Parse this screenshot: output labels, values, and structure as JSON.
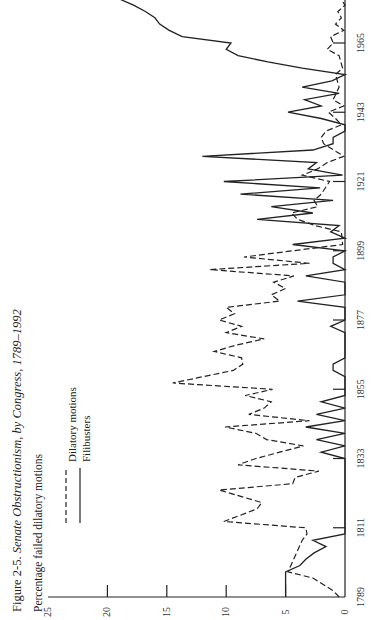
{
  "figure": {
    "title_prefix": "Figure 2-5.",
    "title_italic": "Senate Obstructionism, by Congress, 1789–1992",
    "ylabel": "Percentage failed dilatory motions",
    "legend": [
      {
        "label": "Dilatory motions",
        "style": "dashed"
      },
      {
        "label": "Filibusters",
        "style": "solid"
      }
    ]
  },
  "chart_data": {
    "type": "line",
    "title": "Senate Obstructionism, by Congress, 1789–1992",
    "xlabel": "",
    "ylabel": "Percentage failed dilatory motions",
    "orientation": "rotated -90deg (years run bottom-to-top, values right-to-left)",
    "x_ticks": [
      "1789",
      "1811",
      "1833",
      "1855",
      "1877",
      "1899",
      "1921",
      "1943",
      "1965"
    ],
    "y_ticks": [
      "0",
      "5",
      "10",
      "15",
      "20",
      "25"
    ],
    "ylim": [
      0,
      25
    ],
    "xlim": [
      1789,
      1992
    ],
    "grid": false,
    "legend_position": "upper left (rotated)",
    "series": [
      {
        "name": "Dilatory motions",
        "style": "dashed",
        "points": [
          [
            1789,
            0.5
          ],
          [
            1791,
            1.0
          ],
          [
            1795,
            2.7
          ],
          [
            1797,
            4.8
          ],
          [
            1807,
            3.6
          ],
          [
            1809,
            3.2
          ],
          [
            1811,
            3.3
          ],
          [
            1813,
            10.2
          ],
          [
            1817,
            7.4
          ],
          [
            1819,
            7.0
          ],
          [
            1823,
            10.6
          ],
          [
            1825,
            4.4
          ],
          [
            1827,
            4.2
          ],
          [
            1829,
            2.2
          ],
          [
            1831,
            9.0
          ],
          [
            1833,
            7.5
          ],
          [
            1837,
            3.5
          ],
          [
            1839,
            6.6
          ],
          [
            1841,
            7.5
          ],
          [
            1843,
            10.1
          ],
          [
            1845,
            3.0
          ],
          [
            1847,
            8.1
          ],
          [
            1849,
            6.8
          ],
          [
            1851,
            6.2
          ],
          [
            1853,
            8.4
          ],
          [
            1855,
            6.1
          ],
          [
            1857,
            14.5
          ],
          [
            1861,
            9.4
          ],
          [
            1863,
            8.6
          ],
          [
            1865,
            8.7
          ],
          [
            1867,
            11.0
          ],
          [
            1869,
            9.2
          ],
          [
            1871,
            6.8
          ],
          [
            1873,
            10.0
          ],
          [
            1875,
            8.7
          ],
          [
            1877,
            10.6
          ],
          [
            1879,
            9.3
          ],
          [
            1881,
            10.0
          ],
          [
            1883,
            5.5
          ],
          [
            1885,
            6.2
          ],
          [
            1887,
            5.0
          ],
          [
            1889,
            6.0
          ],
          [
            1891,
            4.3
          ],
          [
            1893,
            11.4
          ],
          [
            1895,
            3.0
          ],
          [
            1897,
            8.5
          ],
          [
            1899,
            4.4
          ],
          [
            1901,
            0.2
          ],
          [
            1905,
            0.3
          ],
          [
            1907,
            2.5
          ],
          [
            1909,
            4.0
          ],
          [
            1911,
            4.5
          ],
          [
            1913,
            2.3
          ],
          [
            1915,
            2.6
          ],
          [
            1917,
            2.0
          ],
          [
            1921,
            1.3
          ],
          [
            1923,
            3.6
          ],
          [
            1925,
            2.3
          ],
          [
            1927,
            1.5
          ],
          [
            1929,
            0.1
          ],
          [
            1933,
            1.8
          ],
          [
            1935,
            2.0
          ],
          [
            1937,
            1.6
          ],
          [
            1939,
            0.3
          ],
          [
            1941,
            0.8
          ],
          [
            1943,
            1.4
          ],
          [
            1945,
            0.1
          ],
          [
            1947,
            1.0
          ],
          [
            1951,
            0.5
          ],
          [
            1955,
            0.8
          ],
          [
            1957,
            0.2
          ],
          [
            1961,
            0.5
          ],
          [
            1963,
            1.5
          ],
          [
            1965,
            1.0
          ],
          [
            1967,
            1.2
          ],
          [
            1969,
            0.1
          ],
          [
            1971,
            0.8
          ],
          [
            1973,
            0.3
          ],
          [
            1975,
            0.6
          ],
          [
            1977,
            0.0
          ],
          [
            1981,
            0.7
          ],
          [
            1983,
            0.2
          ],
          [
            1985,
            0.4
          ],
          [
            1989,
            0.8
          ],
          [
            1991,
            0.2
          ]
        ]
      },
      {
        "name": "Filibusters",
        "style": "solid",
        "points": [
          [
            1789,
            5.0
          ],
          [
            1797,
            5.0
          ],
          [
            1799,
            3.8
          ],
          [
            1801,
            3.3
          ],
          [
            1803,
            2.6
          ],
          [
            1805,
            1.6
          ],
          [
            1807,
            2.7
          ],
          [
            1809,
            0.0
          ],
          [
            1833,
            0.0
          ],
          [
            1835,
            2.0
          ],
          [
            1837,
            0.0
          ],
          [
            1839,
            2.4
          ],
          [
            1841,
            0.0
          ],
          [
            1843,
            3.3
          ],
          [
            1845,
            0.0
          ],
          [
            1847,
            2.4
          ],
          [
            1849,
            0.0
          ],
          [
            1851,
            2.0
          ],
          [
            1853,
            0.0
          ],
          [
            1859,
            0.0
          ],
          [
            1861,
            1.0
          ],
          [
            1863,
            1.0
          ],
          [
            1865,
            0.0
          ],
          [
            1873,
            0.0
          ],
          [
            1875,
            1.2
          ],
          [
            1877,
            0.0
          ],
          [
            1881,
            0.0
          ],
          [
            1883,
            4.0
          ],
          [
            1885,
            0.0
          ],
          [
            1889,
            0.0
          ],
          [
            1891,
            3.3
          ],
          [
            1893,
            0.0
          ],
          [
            1895,
            1.0
          ],
          [
            1897,
            1.0
          ],
          [
            1899,
            0.0
          ],
          [
            1901,
            4.4
          ],
          [
            1903,
            0.0
          ],
          [
            1905,
            1.2
          ],
          [
            1907,
            0.5
          ],
          [
            1909,
            7.4
          ],
          [
            1911,
            2.7
          ],
          [
            1913,
            6.2
          ],
          [
            1915,
            1.0
          ],
          [
            1917,
            8.8
          ],
          [
            1919,
            2.1
          ],
          [
            1921,
            10.2
          ],
          [
            1923,
            0.2
          ],
          [
            1925,
            3.1
          ],
          [
            1927,
            2.4
          ],
          [
            1929,
            12.0
          ],
          [
            1931,
            2.7
          ],
          [
            1933,
            1.0
          ],
          [
            1935,
            1.0
          ],
          [
            1937,
            0.0
          ],
          [
            1939,
            0.0
          ],
          [
            1941,
            2.0
          ],
          [
            1943,
            4.8
          ],
          [
            1945,
            2.0
          ],
          [
            1947,
            3.4
          ],
          [
            1949,
            0.5
          ],
          [
            1951,
            3.6
          ],
          [
            1953,
            1.1
          ],
          [
            1955,
            0.0
          ],
          [
            1957,
            3.6
          ],
          [
            1959,
            6.5
          ],
          [
            1961,
            9.0
          ],
          [
            1963,
            10.0
          ],
          [
            1965,
            9.6
          ],
          [
            1967,
            13.7
          ],
          [
            1969,
            14.8
          ],
          [
            1971,
            15.6
          ],
          [
            1973,
            16.0
          ],
          [
            1975,
            16.8
          ],
          [
            1977,
            17.8
          ],
          [
            1979,
            19.0
          ]
        ]
      }
    ]
  }
}
